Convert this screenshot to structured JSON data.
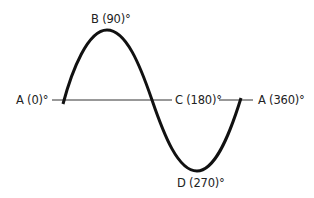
{
  "diagram": {
    "labels": {
      "start": "A (0)°",
      "peak": "B (90)°",
      "mid": "C (180)°",
      "trough": "D (270)°",
      "end": "A (360)°"
    },
    "colors": {
      "curve": "#111111",
      "axis": "#333333",
      "text": "#222222"
    },
    "points": [
      {
        "label": "A",
        "angle": 0,
        "position": "start, zero crossing"
      },
      {
        "label": "B",
        "angle": 90,
        "position": "positive peak"
      },
      {
        "label": "C",
        "angle": 180,
        "position": "zero crossing"
      },
      {
        "label": "D",
        "angle": 270,
        "position": "negative peak"
      },
      {
        "label": "A",
        "angle": 360,
        "position": "end, zero crossing"
      }
    ]
  }
}
